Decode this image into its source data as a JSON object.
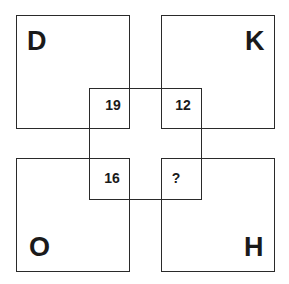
{
  "puzzle": {
    "corners": {
      "top_left": {
        "letter": "D",
        "number": "19"
      },
      "top_right": {
        "letter": "K",
        "number": "12"
      },
      "bottom_left": {
        "letter": "O",
        "number": "16"
      },
      "bottom_right": {
        "letter": "H",
        "number": "?"
      }
    },
    "colors": {
      "line": "#2a2a2a",
      "text": "#1a1a1a",
      "background": "#ffffff"
    }
  }
}
